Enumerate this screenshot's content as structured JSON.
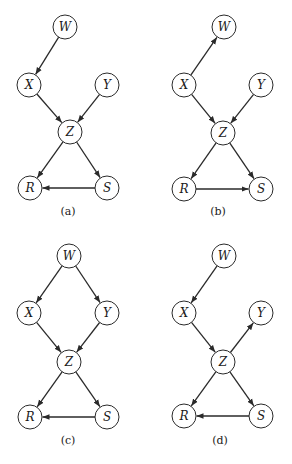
{
  "figure": {
    "node_radius": 12,
    "panels": [
      {
        "id": "a",
        "caption": "(a)",
        "caption_pos": [
          68,
          215
        ],
        "nodes": [
          {
            "id": "W",
            "label": "W",
            "x": 65,
            "y": 27
          },
          {
            "id": "X",
            "label": "X",
            "x": 29,
            "y": 85
          },
          {
            "id": "Y",
            "label": "Y",
            "x": 107,
            "y": 85
          },
          {
            "id": "Z",
            "label": "Z",
            "x": 70,
            "y": 132
          },
          {
            "id": "R",
            "label": "R",
            "x": 30,
            "y": 188
          },
          {
            "id": "S",
            "label": "S",
            "x": 107,
            "y": 188
          }
        ],
        "edges": [
          {
            "from": "W",
            "to": "X"
          },
          {
            "from": "X",
            "to": "Z"
          },
          {
            "from": "Y",
            "to": "Z"
          },
          {
            "from": "Z",
            "to": "R"
          },
          {
            "from": "Z",
            "to": "S"
          },
          {
            "from": "S",
            "to": "R"
          }
        ]
      },
      {
        "id": "b",
        "caption": "(b)",
        "caption_pos": [
          218,
          215
        ],
        "nodes": [
          {
            "id": "W",
            "label": "W",
            "x": 224,
            "y": 27
          },
          {
            "id": "X",
            "label": "X",
            "x": 184,
            "y": 85
          },
          {
            "id": "Y",
            "label": "Y",
            "x": 261,
            "y": 85
          },
          {
            "id": "Z",
            "label": "Z",
            "x": 223,
            "y": 133
          },
          {
            "id": "R",
            "label": "R",
            "x": 184,
            "y": 189
          },
          {
            "id": "S",
            "label": "S",
            "x": 261,
            "y": 189
          }
        ],
        "edges": [
          {
            "from": "X",
            "to": "W"
          },
          {
            "from": "X",
            "to": "Z"
          },
          {
            "from": "Y",
            "to": "Z"
          },
          {
            "from": "Z",
            "to": "R"
          },
          {
            "from": "Z",
            "to": "S"
          },
          {
            "from": "R",
            "to": "S"
          }
        ]
      },
      {
        "id": "c",
        "caption": "(c)",
        "caption_pos": [
          68,
          444
        ],
        "nodes": [
          {
            "id": "W",
            "label": "W",
            "x": 69,
            "y": 256
          },
          {
            "id": "X",
            "label": "X",
            "x": 29,
            "y": 313
          },
          {
            "id": "Y",
            "label": "Y",
            "x": 107,
            "y": 313
          },
          {
            "id": "Z",
            "label": "Z",
            "x": 69,
            "y": 362
          },
          {
            "id": "R",
            "label": "R",
            "x": 30,
            "y": 417
          },
          {
            "id": "S",
            "label": "S",
            "x": 107,
            "y": 417
          }
        ],
        "edges": [
          {
            "from": "W",
            "to": "X"
          },
          {
            "from": "W",
            "to": "Y"
          },
          {
            "from": "X",
            "to": "Z"
          },
          {
            "from": "Y",
            "to": "Z"
          },
          {
            "from": "Z",
            "to": "R"
          },
          {
            "from": "Z",
            "to": "S"
          },
          {
            "from": "S",
            "to": "R"
          }
        ]
      },
      {
        "id": "d",
        "caption": "(d)",
        "caption_pos": [
          220,
          444
        ],
        "nodes": [
          {
            "id": "W",
            "label": "W",
            "x": 224,
            "y": 256
          },
          {
            "id": "X",
            "label": "X",
            "x": 184,
            "y": 313
          },
          {
            "id": "Y",
            "label": "Y",
            "x": 261,
            "y": 313
          },
          {
            "id": "Z",
            "label": "Z",
            "x": 223,
            "y": 362
          },
          {
            "id": "R",
            "label": "R",
            "x": 184,
            "y": 416
          },
          {
            "id": "S",
            "label": "S",
            "x": 261,
            "y": 416
          }
        ],
        "edges": [
          {
            "from": "W",
            "to": "X"
          },
          {
            "from": "X",
            "to": "Z"
          },
          {
            "from": "Z",
            "to": "Y"
          },
          {
            "from": "Z",
            "to": "R"
          },
          {
            "from": "Z",
            "to": "S"
          },
          {
            "from": "S",
            "to": "R"
          }
        ]
      }
    ]
  }
}
